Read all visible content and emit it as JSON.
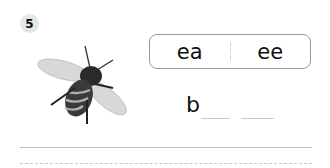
{
  "exercise": {
    "number": "5",
    "image": "bee-icon",
    "choices": [
      "ea",
      "ee"
    ],
    "word_start": "b",
    "blank_count": 2
  }
}
